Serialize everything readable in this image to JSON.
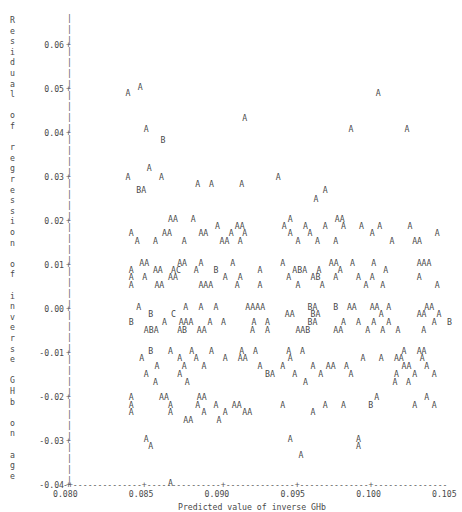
{
  "chart_data": {
    "type": "scatter",
    "title": "",
    "xlabel": "Predicted value of inverse GHb",
    "ylabel": "Residual of regression of inverse GHb on age",
    "xlim": [
      0.0785,
      0.1065
    ],
    "ylim": [
      -0.045,
      0.065
    ],
    "xticks": [
      "0.080",
      "0.085",
      "0.090",
      "0.095",
      "0.100",
      "0.105"
    ],
    "xtick_values": [
      0.08,
      0.085,
      0.09,
      0.095,
      0.1,
      0.105
    ],
    "yticks": [
      "0.06",
      "0.05",
      "0.04",
      "0.03",
      "0.02",
      "0.01",
      "0.00",
      "-0.01",
      "-0.02",
      "-0.03",
      "-0.04"
    ],
    "ytick_values": [
      0.06,
      0.05,
      0.04,
      0.03,
      0.02,
      0.01,
      0.0,
      -0.01,
      -0.02,
      -0.03,
      -0.04
    ],
    "grid": false,
    "legend": "",
    "marker_encoding": "Letter codes denote number of coincident observations: A = 1, B = 2, C = 3",
    "axis_style": "ascii-character-plot",
    "tick_symbol": "+",
    "axis_dash": "-",
    "axis_vertical": "|",
    "rows": [
      {
        "y": 0.0505,
        "cells": [
          {
            "x": 0.0846,
            "s": "A"
          }
        ]
      },
      {
        "y": 0.049,
        "cells": [
          {
            "x": 0.0838,
            "s": "A"
          },
          {
            "x": 0.1003,
            "s": "A"
          }
        ]
      },
      {
        "y": 0.0435,
        "cells": [
          {
            "x": 0.0915,
            "s": "A"
          }
        ]
      },
      {
        "y": 0.041,
        "cells": [
          {
            "x": 0.085,
            "s": "A"
          },
          {
            "x": 0.0985,
            "s": "A"
          },
          {
            "x": 0.1022,
            "s": "A"
          }
        ]
      },
      {
        "y": 0.0385,
        "cells": [
          {
            "x": 0.0861,
            "s": "B"
          }
        ]
      },
      {
        "y": 0.032,
        "cells": [
          {
            "x": 0.0852,
            "s": "A"
          }
        ]
      },
      {
        "y": 0.03,
        "cells": [
          {
            "x": 0.0838,
            "s": "A"
          },
          {
            "x": 0.086,
            "s": "A"
          },
          {
            "x": 0.0937,
            "s": "A"
          }
        ]
      },
      {
        "y": 0.0285,
        "cells": [
          {
            "x": 0.0884,
            "s": "A"
          },
          {
            "x": 0.0893,
            "s": "A"
          },
          {
            "x": 0.0913,
            "s": "A"
          }
        ]
      },
      {
        "y": 0.027,
        "cells": [
          {
            "x": 0.0845,
            "s": "BA"
          },
          {
            "x": 0.0968,
            "s": "A"
          }
        ]
      },
      {
        "y": 0.025,
        "cells": [
          {
            "x": 0.0962,
            "s": "A"
          }
        ]
      },
      {
        "y": 0.0205,
        "cells": [
          {
            "x": 0.0866,
            "s": "AA"
          },
          {
            "x": 0.0881,
            "s": "A"
          },
          {
            "x": 0.0945,
            "s": "A"
          },
          {
            "x": 0.0976,
            "s": "AA"
          }
        ]
      },
      {
        "y": 0.0188,
        "cells": [
          {
            "x": 0.0897,
            "s": "A"
          },
          {
            "x": 0.091,
            "s": "AA"
          },
          {
            "x": 0.0941,
            "s": "A"
          },
          {
            "x": 0.0955,
            "s": "A"
          },
          {
            "x": 0.0968,
            "s": "A"
          },
          {
            "x": 0.098,
            "s": "A"
          },
          {
            "x": 0.0992,
            "s": "A"
          },
          {
            "x": 0.1004,
            "s": "A"
          },
          {
            "x": 0.1024,
            "s": "A"
          }
        ]
      },
      {
        "y": 0.0172,
        "cells": [
          {
            "x": 0.084,
            "s": "A"
          },
          {
            "x": 0.0862,
            "s": "AA"
          },
          {
            "x": 0.0886,
            "s": "AA"
          },
          {
            "x": 0.0906,
            "s": "A"
          },
          {
            "x": 0.0915,
            "s": "A"
          },
          {
            "x": 0.0945,
            "s": "A"
          },
          {
            "x": 0.0958,
            "s": "A"
          },
          {
            "x": 0.0999,
            "s": "A"
          },
          {
            "x": 0.1042,
            "s": "A"
          }
        ]
      },
      {
        "y": 0.0155,
        "cells": [
          {
            "x": 0.0844,
            "s": "A"
          },
          {
            "x": 0.0856,
            "s": "A"
          },
          {
            "x": 0.0875,
            "s": "A"
          },
          {
            "x": 0.09,
            "s": "AA"
          },
          {
            "x": 0.0912,
            "s": "A"
          },
          {
            "x": 0.095,
            "s": "A"
          },
          {
            "x": 0.0963,
            "s": "A"
          },
          {
            "x": 0.0975,
            "s": "A"
          },
          {
            "x": 0.1012,
            "s": "A"
          },
          {
            "x": 0.1027,
            "s": "AA"
          }
        ]
      },
      {
        "y": 0.0105,
        "cells": [
          {
            "x": 0.0847,
            "s": "AA"
          },
          {
            "x": 0.0872,
            "s": "AA"
          },
          {
            "x": 0.0886,
            "s": "A"
          },
          {
            "x": 0.0907,
            "s": "A"
          },
          {
            "x": 0.094,
            "s": "A"
          },
          {
            "x": 0.0972,
            "s": "AA"
          },
          {
            "x": 0.0986,
            "s": "A"
          },
          {
            "x": 0.1,
            "s": "A"
          },
          {
            "x": 0.103,
            "s": "AAA"
          }
        ]
      },
      {
        "y": 0.0088,
        "cells": [
          {
            "x": 0.084,
            "s": "A"
          },
          {
            "x": 0.0856,
            "s": "AA"
          },
          {
            "x": 0.0868,
            "s": "AC"
          },
          {
            "x": 0.0883,
            "s": "A"
          },
          {
            "x": 0.0896,
            "s": "B"
          },
          {
            "x": 0.0925,
            "s": "A"
          },
          {
            "x": 0.0948,
            "s": "ABA"
          },
          {
            "x": 0.0964,
            "s": "A"
          },
          {
            "x": 0.0978,
            "s": "A"
          },
          {
            "x": 0.1008,
            "s": "A"
          }
        ]
      },
      {
        "y": 0.0072,
        "cells": [
          {
            "x": 0.084,
            "s": "A"
          },
          {
            "x": 0.0849,
            "s": "A"
          },
          {
            "x": 0.0866,
            "s": "AA"
          },
          {
            "x": 0.0902,
            "s": "A"
          },
          {
            "x": 0.0912,
            "s": "A"
          },
          {
            "x": 0.0944,
            "s": "A"
          },
          {
            "x": 0.096,
            "s": "AB"
          },
          {
            "x": 0.0975,
            "s": "A"
          },
          {
            "x": 0.099,
            "s": "A"
          },
          {
            "x": 0.0999,
            "s": "A"
          },
          {
            "x": 0.103,
            "s": "A"
          }
        ]
      },
      {
        "y": 0.0055,
        "cells": [
          {
            "x": 0.084,
            "s": "A"
          },
          {
            "x": 0.0857,
            "s": "AA"
          },
          {
            "x": 0.0886,
            "s": "AAA"
          },
          {
            "x": 0.091,
            "s": "A"
          },
          {
            "x": 0.0925,
            "s": "A"
          },
          {
            "x": 0.095,
            "s": "A"
          },
          {
            "x": 0.0966,
            "s": "A"
          },
          {
            "x": 0.0995,
            "s": "A"
          },
          {
            "x": 0.1006,
            "s": "A"
          },
          {
            "x": 0.1042,
            "s": "A"
          }
        ]
      },
      {
        "y": 0.0005,
        "cells": [
          {
            "x": 0.0845,
            "s": "A"
          },
          {
            "x": 0.0876,
            "s": "A"
          },
          {
            "x": 0.0886,
            "s": "A"
          },
          {
            "x": 0.0896,
            "s": "A"
          },
          {
            "x": 0.0917,
            "s": "AAAA"
          },
          {
            "x": 0.0958,
            "s": "BA"
          },
          {
            "x": 0.0975,
            "s": "B"
          },
          {
            "x": 0.0984,
            "s": "AA"
          },
          {
            "x": 0.0999,
            "s": "AA"
          },
          {
            "x": 0.101,
            "s": "A"
          },
          {
            "x": 0.1035,
            "s": "AA"
          }
        ]
      },
      {
        "y": -0.0012,
        "cells": [
          {
            "x": 0.0853,
            "s": "B"
          },
          {
            "x": 0.0868,
            "s": "C"
          },
          {
            "x": 0.0943,
            "s": "AA"
          },
          {
            "x": 0.096,
            "s": "BA"
          },
          {
            "x": 0.1005,
            "s": "A"
          },
          {
            "x": 0.103,
            "s": "AA"
          },
          {
            "x": 0.1043,
            "s": "A"
          }
        ]
      },
      {
        "y": -0.003,
        "cells": [
          {
            "x": 0.084,
            "s": "B"
          },
          {
            "x": 0.0862,
            "s": "A"
          },
          {
            "x": 0.0873,
            "s": "AAA"
          },
          {
            "x": 0.0892,
            "s": "A"
          },
          {
            "x": 0.0901,
            "s": "A"
          },
          {
            "x": 0.0921,
            "s": "A"
          },
          {
            "x": 0.093,
            "s": "A"
          },
          {
            "x": 0.0958,
            "s": "BA"
          },
          {
            "x": 0.098,
            "s": "A"
          },
          {
            "x": 0.099,
            "s": "A"
          },
          {
            "x": 0.1,
            "s": "A"
          },
          {
            "x": 0.101,
            "s": "A"
          },
          {
            "x": 0.104,
            "s": "A"
          },
          {
            "x": 0.105,
            "s": "B"
          }
        ]
      },
      {
        "y": -0.0047,
        "cells": [
          {
            "x": 0.085,
            "s": "ABA"
          },
          {
            "x": 0.0872,
            "s": "AB"
          },
          {
            "x": 0.0885,
            "s": "AA"
          },
          {
            "x": 0.092,
            "s": "A"
          },
          {
            "x": 0.093,
            "s": "A"
          },
          {
            "x": 0.095,
            "s": "AAB"
          },
          {
            "x": 0.0975,
            "s": "AA"
          },
          {
            "x": 0.0996,
            "s": "A"
          },
          {
            "x": 0.1006,
            "s": "A"
          },
          {
            "x": 0.1016,
            "s": "A"
          },
          {
            "x": 0.1033,
            "s": "A"
          }
        ]
      },
      {
        "y": -0.0095,
        "cells": [
          {
            "x": 0.0853,
            "s": "B"
          },
          {
            "x": 0.0866,
            "s": "A"
          },
          {
            "x": 0.088,
            "s": "A"
          },
          {
            "x": 0.0893,
            "s": "A"
          },
          {
            "x": 0.0913,
            "s": "A"
          },
          {
            "x": 0.0922,
            "s": "A"
          },
          {
            "x": 0.0944,
            "s": "A"
          },
          {
            "x": 0.0953,
            "s": "A"
          },
          {
            "x": 0.102,
            "s": "A"
          },
          {
            "x": 0.103,
            "s": "AA"
          }
        ]
      },
      {
        "y": -0.0112,
        "cells": [
          {
            "x": 0.0847,
            "s": "A"
          },
          {
            "x": 0.0872,
            "s": "A"
          },
          {
            "x": 0.0883,
            "s": "A"
          },
          {
            "x": 0.0902,
            "s": "A"
          },
          {
            "x": 0.0912,
            "s": "AA"
          },
          {
            "x": 0.0945,
            "s": "A"
          },
          {
            "x": 0.0993,
            "s": "A"
          },
          {
            "x": 0.1005,
            "s": "A"
          },
          {
            "x": 0.1015,
            "s": "AA"
          },
          {
            "x": 0.1032,
            "s": "A"
          }
        ]
      },
      {
        "y": -0.013,
        "cells": [
          {
            "x": 0.0857,
            "s": "A"
          },
          {
            "x": 0.0875,
            "s": "A"
          },
          {
            "x": 0.0888,
            "s": "A"
          },
          {
            "x": 0.0925,
            "s": "A"
          },
          {
            "x": 0.094,
            "s": "A"
          },
          {
            "x": 0.096,
            "s": "A"
          },
          {
            "x": 0.097,
            "s": "AA"
          },
          {
            "x": 0.0982,
            "s": "A"
          },
          {
            "x": 0.102,
            "s": "AA"
          },
          {
            "x": 0.1035,
            "s": "A"
          }
        ]
      },
      {
        "y": -0.0148,
        "cells": [
          {
            "x": 0.085,
            "s": "A"
          },
          {
            "x": 0.0872,
            "s": "A"
          },
          {
            "x": 0.093,
            "s": "BA"
          },
          {
            "x": 0.0948,
            "s": "A"
          },
          {
            "x": 0.0965,
            "s": "A"
          },
          {
            "x": 0.0985,
            "s": "A"
          },
          {
            "x": 0.1015,
            "s": "A"
          },
          {
            "x": 0.1027,
            "s": "A"
          },
          {
            "x": 0.104,
            "s": "A"
          }
        ]
      },
      {
        "y": -0.0165,
        "cells": [
          {
            "x": 0.0856,
            "s": "A"
          },
          {
            "x": 0.0877,
            "s": "A"
          },
          {
            "x": 0.0955,
            "s": "A"
          },
          {
            "x": 0.1014,
            "s": "A"
          },
          {
            "x": 0.1023,
            "s": "A"
          }
        ]
      },
      {
        "y": -0.02,
        "cells": [
          {
            "x": 0.084,
            "s": "A"
          },
          {
            "x": 0.086,
            "s": "AA"
          },
          {
            "x": 0.0885,
            "s": "AA"
          },
          {
            "x": 0.1002,
            "s": "A"
          },
          {
            "x": 0.1035,
            "s": "A"
          }
        ]
      },
      {
        "y": -0.0218,
        "cells": [
          {
            "x": 0.084,
            "s": "A"
          },
          {
            "x": 0.0866,
            "s": "A"
          },
          {
            "x": 0.0884,
            "s": "A"
          },
          {
            "x": 0.0896,
            "s": "A"
          },
          {
            "x": 0.0908,
            "s": "AA"
          },
          {
            "x": 0.094,
            "s": "A"
          },
          {
            "x": 0.0968,
            "s": "A"
          },
          {
            "x": 0.098,
            "s": "A"
          },
          {
            "x": 0.0998,
            "s": "B"
          },
          {
            "x": 0.1027,
            "s": "A"
          },
          {
            "x": 0.104,
            "s": "A"
          }
        ]
      },
      {
        "y": -0.0235,
        "cells": [
          {
            "x": 0.084,
            "s": "A"
          },
          {
            "x": 0.0866,
            "s": "A"
          },
          {
            "x": 0.0888,
            "s": "A"
          },
          {
            "x": 0.0902,
            "s": "A"
          },
          {
            "x": 0.0915,
            "s": "AA"
          },
          {
            "x": 0.096,
            "s": "A"
          }
        ]
      },
      {
        "y": -0.0253,
        "cells": [
          {
            "x": 0.0876,
            "s": "AA"
          },
          {
            "x": 0.0898,
            "s": "A"
          }
        ]
      },
      {
        "y": -0.0295,
        "cells": [
          {
            "x": 0.085,
            "s": "A"
          },
          {
            "x": 0.0945,
            "s": "A"
          },
          {
            "x": 0.099,
            "s": "A"
          }
        ]
      },
      {
        "y": -0.0312,
        "cells": [
          {
            "x": 0.0853,
            "s": "A"
          },
          {
            "x": 0.099,
            "s": "A"
          }
        ]
      },
      {
        "y": -0.0332,
        "cells": [
          {
            "x": 0.0952,
            "s": "A"
          }
        ]
      },
      {
        "y": -0.0395,
        "cells": [
          {
            "x": 0.0866,
            "s": "A"
          }
        ]
      }
    ]
  },
  "axis": {
    "y_axis_label_chars": [
      "R",
      "e",
      "s",
      "i",
      "d",
      "u",
      "a",
      "l",
      "",
      "o",
      "f",
      "",
      "r",
      "e",
      "g",
      "r",
      "e",
      "s",
      "s",
      "i",
      "o",
      "n",
      "",
      "o",
      "f",
      "",
      "i",
      "n",
      "v",
      "e",
      "r",
      "s",
      "e",
      "",
      "G",
      "H",
      "b",
      "",
      "o",
      "n",
      "",
      "a",
      "g",
      "e"
    ]
  }
}
